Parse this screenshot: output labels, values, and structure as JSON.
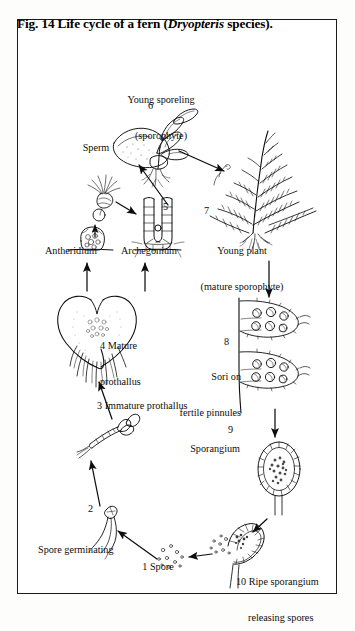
{
  "figure": {
    "title_prefix": "Fig. 14 Life cycle of a fern (",
    "title_italic": "Dryopteris",
    "title_suffix": " species).",
    "title_full": "Fig. 14 Life cycle of a fern (Dryopteris species).",
    "border_color": "#1a1a1a",
    "ink_color": "#0d0d0d",
    "background_color": "#ffffff"
  },
  "labels": {
    "young_sporeling_line1": "Young sporeling",
    "young_sporeling_line2": "(sporophyte)",
    "young_plant_line1": "Young plant",
    "young_plant_line2": "(mature sporophyte)",
    "sperm": "Sperm",
    "antheridium": "Antheridium",
    "archegonium": "Archegonium",
    "mature_prothallus": "4 Mature\nprothallus",
    "immature_prothallus": "3 Immature prothallus",
    "spore_germinating": "Spore germinating",
    "spore": "1 Spore",
    "sori_line1": "Sori on",
    "sori_line2": "fertile pinnules",
    "sporangium": "Sporangium",
    "ripe_sporangium_line1": "10 Ripe sporangium",
    "ripe_sporangium_line2": "releasing spores"
  },
  "stage_numbers": {
    "n1": "1",
    "n2": "2",
    "n3": "3",
    "n4": "4",
    "n5": "5",
    "n6": "6",
    "n7": "7",
    "n8": "8",
    "n9": "9",
    "n10": "10"
  },
  "stages": [
    {
      "number": "1",
      "name": "Spore"
    },
    {
      "number": "2",
      "name": "Spore germinating"
    },
    {
      "number": "3",
      "name": "Immature prothallus"
    },
    {
      "number": "4",
      "name": "Mature prothallus"
    },
    {
      "number": "5",
      "name": "Archegonium"
    },
    {
      "number": "6",
      "name": "Young sporeling (sporophyte)"
    },
    {
      "number": "7",
      "name": "Young plant (mature sporophyte)"
    },
    {
      "number": "8",
      "name": "Sori on fertile pinnules"
    },
    {
      "number": "9",
      "name": "Sporangium"
    },
    {
      "number": "10",
      "name": "Ripe sporangium releasing spores"
    }
  ]
}
